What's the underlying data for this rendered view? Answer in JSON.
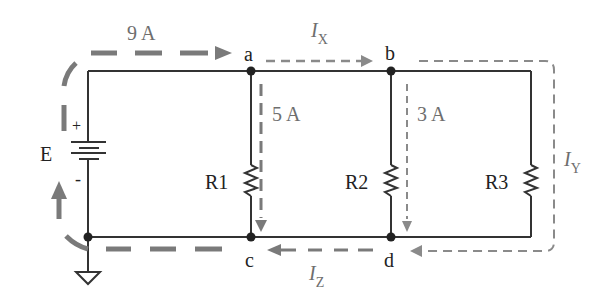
{
  "diagram": {
    "colors": {
      "wire": "#333333",
      "node": "#222222",
      "thick_arrow": "#7a7a7a",
      "thin_arrow": "#8a8a8a",
      "label": "#222222",
      "current_label": "#6e6e6e"
    },
    "source": {
      "label": "E",
      "plus": "+",
      "minus": "-"
    },
    "nodes": {
      "a": "a",
      "b": "b",
      "c": "c",
      "d": "d"
    },
    "resistors": {
      "r1": "R1",
      "r2": "R2",
      "r3": "R3"
    },
    "currents": {
      "total": "9 A",
      "r1": "5 A",
      "r2": "3 A",
      "ix": {
        "main": "I",
        "sub": "X"
      },
      "iy": {
        "main": "I",
        "sub": "Y"
      },
      "iz": {
        "main": "I",
        "sub": "Z"
      }
    },
    "ground": "ground-symbol"
  }
}
